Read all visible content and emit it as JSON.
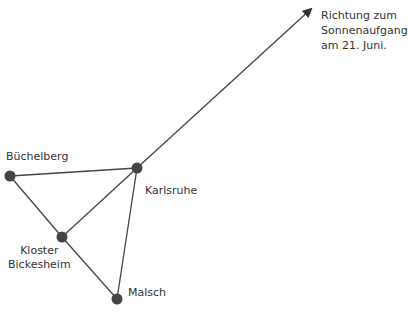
{
  "diagram": {
    "colors": {
      "line": "#444444",
      "node": "#444444",
      "text": "#333333",
      "background": "#ffffff"
    },
    "nodes": [
      {
        "id": "karlsruhe",
        "label": "Karlsruhe",
        "x": 137,
        "y": 168
      },
      {
        "id": "buechelberg",
        "label": "Büchelberg",
        "x": 10,
        "y": 176
      },
      {
        "id": "kloster-bickesheim",
        "label": "Kloster\nBickesheim",
        "x": 62,
        "y": 237
      },
      {
        "id": "malsch",
        "label": "Malsch",
        "x": 117,
        "y": 299
      }
    ],
    "edges": [
      [
        "buechelberg",
        "karlsruhe"
      ],
      [
        "buechelberg",
        "kloster-bickesheim"
      ],
      [
        "kloster-bickesheim",
        "karlsruhe"
      ],
      [
        "kloster-bickesheim",
        "malsch"
      ],
      [
        "karlsruhe",
        "malsch"
      ]
    ],
    "arrow": {
      "from": "karlsruhe",
      "to_x": 313,
      "to_y": 7,
      "label": "Richtung zum\nSonnenaufgang\nam 21. Juni."
    }
  }
}
